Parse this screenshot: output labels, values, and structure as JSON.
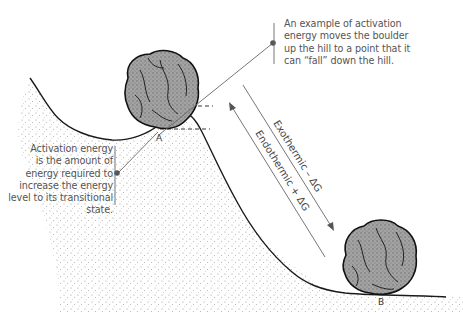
{
  "diagram": {
    "callouts": {
      "top_right": {
        "lines": [
          "An example of activation",
          "energy moves the boulder",
          "up the hill to a point that it",
          "can “fall” down the hill."
        ]
      },
      "left": {
        "lines": [
          "Activation energy",
          "is the amount of",
          "energy required to",
          "increase the energy",
          "level to its transitional",
          "state."
        ]
      }
    },
    "arrows": {
      "exothermic": "Exothermic – ΔG",
      "endothermic": "Endothermic + ΔG"
    },
    "points": {
      "a": "A",
      "b": "B"
    },
    "colors": {
      "ink": "#1a1a1a",
      "rock_fill": "#9a9a9a",
      "stipple": "#8a8a8a",
      "text": "#555555",
      "leader": "#666666"
    }
  }
}
